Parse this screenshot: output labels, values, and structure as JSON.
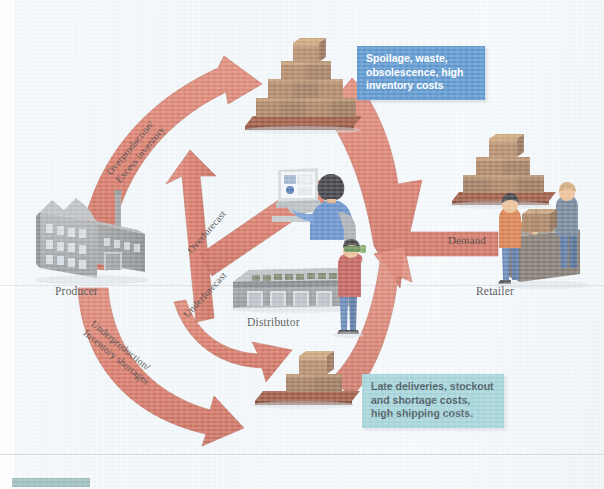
{
  "figure": {
    "nodes": [
      {
        "id": "producer",
        "label": "Producer",
        "icon": "factory-icon"
      },
      {
        "id": "distributor",
        "label": "Distributor",
        "icon": "warehouse-icon"
      },
      {
        "id": "retailer",
        "label": "Retailer",
        "icon": "store-workers-icon"
      }
    ],
    "arrow_labels": [
      {
        "id": "overproduction",
        "text": "Overproduction/\nExcess inventory"
      },
      {
        "id": "overforecast",
        "text": "Overforecast"
      },
      {
        "id": "underforecast",
        "text": "Underforecast"
      },
      {
        "id": "underproduction",
        "text": "Underproduction/\nInventory shortages"
      },
      {
        "id": "demand",
        "text": "Demand"
      }
    ],
    "callouts": [
      {
        "id": "callout-top",
        "text": "Spoilage, waste,\nobsolescence, high\ninventory costs",
        "bg": "#3c81c4",
        "fg": "#ffffff"
      },
      {
        "id": "callout-bottom",
        "text": "Late deliveries, stockout\nand shortage costs,\nhigh shipping costs.",
        "bg": "#93cbd2",
        "fg": "#20343c"
      }
    ],
    "stacks": [
      {
        "id": "stack-excess-top",
        "rows": [
          1,
          2,
          3,
          4
        ],
        "note": "large pyramid of cartons"
      },
      {
        "id": "stack-retailer",
        "rows": [
          1,
          2,
          3
        ],
        "note": "medium pyramid of cartons"
      },
      {
        "id": "stack-shortage-bottom",
        "rows": [
          1,
          2
        ],
        "note": "small stack of cartons"
      }
    ],
    "colors": {
      "arrow": "#cf5b45",
      "arrow_dark": "#b9472f",
      "carton": "#9a6a44",
      "carton_light": "#b08055",
      "carton_dark": "#7d5334",
      "pallet": "#8b3a1e",
      "building": "#9a9c9e",
      "building_dark": "#7c7e80",
      "page": "#eef4f8",
      "callout_top": "#3c81c4",
      "callout_bottom": "#93cbd2",
      "hairline": "#b696aa",
      "chip": "#7fa7a8"
    }
  }
}
